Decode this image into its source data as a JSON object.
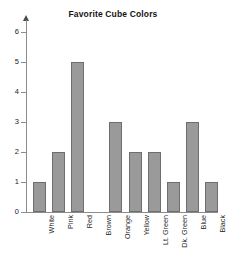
{
  "chart_data": {
    "type": "bar",
    "title": "Favorite Cube Colors",
    "xlabel": "",
    "ylabel": "",
    "categories": [
      "White",
      "Pink",
      "Red",
      "Brown",
      "Orange",
      "Yellow",
      "Lt. Green",
      "Dk. Green",
      "Blue",
      "Black"
    ],
    "values": [
      1,
      2,
      5,
      0,
      3,
      2,
      2,
      1,
      3,
      1
    ],
    "ylim": [
      0,
      6
    ],
    "yticks": [
      0,
      1,
      2,
      3,
      4,
      5,
      6
    ],
    "ytick_labels": [
      "0",
      "1",
      "2",
      "3",
      "4",
      "5",
      "6"
    ],
    "grid": false,
    "legend": false,
    "bar_color": "#9a9a9a",
    "bar_border_color": "#6e6e6e",
    "axis_color": "#8c8c8c",
    "background": "#ffffff",
    "xlabel_rotation": -90
  }
}
